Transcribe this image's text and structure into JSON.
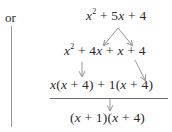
{
  "label_or": "or",
  "steps": [
    {
      "id": "original",
      "parts": [
        "x",
        "2",
        " + 5",
        "x",
        " + 4"
      ]
    },
    {
      "id": "split",
      "parts": [
        "x",
        "2",
        " + 4",
        "x",
        " + ",
        "x",
        " + 4"
      ]
    },
    {
      "id": "grouped",
      "parts": [
        "x",
        "(",
        "x",
        " + 4) + 1(",
        "x",
        " + 4)"
      ]
    },
    {
      "id": "factored",
      "parts": [
        "(",
        "x",
        " + 1)(",
        "x",
        " + 4)"
      ]
    }
  ],
  "colors": {
    "text": "#2a2a2a",
    "rule": "#6a6a6a",
    "arrow": "#8a8a8a",
    "vline": "#9a9a9a"
  }
}
